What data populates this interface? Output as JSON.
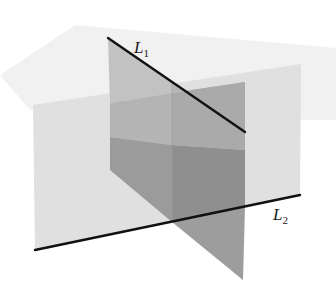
{
  "diagram": {
    "labels": {
      "line1": {
        "main": "L",
        "subscript": "1"
      },
      "line2": {
        "main": "L",
        "subscript": "2"
      }
    },
    "colors": {
      "background": "#ffffff",
      "faint_plane": "#ececec",
      "back_plane": "#e2e2e2",
      "l1_plane_light": "#bdbdbd",
      "l1_plane_light_right": "#b3b3b3",
      "l1_plane_dark": "#9a9a9a",
      "l1_plane_dark_right": "#8e8e8e",
      "l1_plane_lower": "#a6a6a6",
      "line": "#111111"
    },
    "geometry": {
      "L1": {
        "x1": 108,
        "y1": 38,
        "x2": 245,
        "y2": 132
      },
      "L2": {
        "x1": 35,
        "y1": 250,
        "x2": 300,
        "y2": 195
      }
    }
  }
}
